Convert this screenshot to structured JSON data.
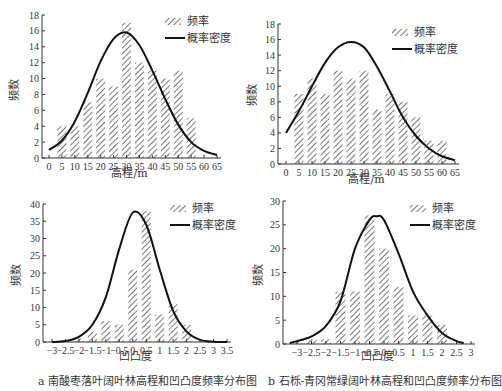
{
  "chart_data": [
    {
      "id": "a-top",
      "type": "bar",
      "title": "",
      "xlabel": "高程/m",
      "ylabel": "频数",
      "x_ticks": [
        "0",
        "5",
        "10",
        "15",
        "20",
        "25",
        "30",
        "35",
        "40",
        "45",
        "50",
        "55",
        "60",
        "65"
      ],
      "y_ticks": [
        "0",
        "2",
        "4",
        "6",
        "8",
        "10",
        "12",
        "14",
        "16",
        "18"
      ],
      "ylim": [
        0,
        18
      ],
      "xlim": [
        0,
        65
      ],
      "categories": [
        5,
        10,
        15,
        20,
        25,
        30,
        35,
        40,
        45,
        50,
        55
      ],
      "series": [
        {
          "name": "频率",
          "type": "bar",
          "values": [
            4,
            4,
            7,
            10,
            9,
            17,
            12,
            11,
            10,
            11,
            5
          ]
        },
        {
          "name": "概率密度",
          "type": "line",
          "x": [
            0,
            5,
            10,
            15,
            20,
            25,
            30,
            35,
            40,
            45,
            50,
            55,
            60,
            65
          ],
          "values": [
            1,
            2.2,
            4.6,
            8.2,
            12.2,
            15,
            15.8,
            14.2,
            11,
            7.4,
            4.2,
            2,
            0.9,
            0.4
          ]
        }
      ],
      "legend": [
        "频率",
        "概率密度"
      ],
      "legend_position": "top-right"
    },
    {
      "id": "b-top",
      "type": "bar",
      "title": "",
      "xlabel": "高程/m",
      "ylabel": "频数",
      "x_ticks": [
        "0",
        "5",
        "10",
        "15",
        "20",
        "25",
        "30",
        "35",
        "40",
        "45",
        "50",
        "55",
        "60",
        "65"
      ],
      "y_ticks": [
        "0",
        "2",
        "4",
        "6",
        "8",
        "10",
        "12",
        "14",
        "16",
        "18"
      ],
      "ylim": [
        0,
        18
      ],
      "xlim": [
        0,
        65
      ],
      "categories": [
        5,
        10,
        15,
        20,
        25,
        30,
        35,
        40,
        45,
        50,
        55,
        60
      ],
      "series": [
        {
          "name": "频率",
          "type": "bar",
          "values": [
            9,
            11,
            9,
            12,
            11,
            12,
            7,
            9,
            8,
            6,
            3,
            3
          ]
        },
        {
          "name": "概率密度",
          "type": "line",
          "x": [
            0,
            5,
            10,
            15,
            20,
            25,
            30,
            35,
            40,
            45,
            50,
            55,
            60,
            65
          ],
          "values": [
            4,
            6.8,
            10,
            13,
            15,
            15.7,
            15,
            12.5,
            9.3,
            6,
            3.6,
            2,
            1,
            0.5
          ]
        }
      ],
      "legend": [
        "频率",
        "概率密度"
      ],
      "legend_position": "top-right"
    },
    {
      "id": "a-bottom",
      "type": "bar",
      "title": "a 南酸枣落叶阔叶林高程和凹凸度频率分布图",
      "xlabel": "凹凸度",
      "ylabel": "频数",
      "x_ticks": [
        "-3",
        "-2.5",
        "-2",
        "-1.5",
        "-1",
        "-0.5",
        "0",
        "0.5",
        "1",
        "1.5",
        "2",
        "2.5",
        "3",
        "3.5"
      ],
      "y_ticks": [
        "0",
        "5",
        "10",
        "15",
        "20",
        "25",
        "30",
        "35",
        "40"
      ],
      "ylim": [
        0,
        40
      ],
      "xlim": [
        -3,
        3.5
      ],
      "categories": [
        -2,
        -1.5,
        -1,
        -0.5,
        0,
        0.5,
        1,
        1.5,
        2
      ],
      "series": [
        {
          "name": "频率",
          "type": "bar",
          "values": [
            1,
            3,
            6,
            5,
            21,
            38,
            8,
            11,
            5
          ]
        },
        {
          "name": "概率密度",
          "type": "line",
          "x": [
            -3,
            -2.5,
            -2,
            -1.5,
            -1,
            -0.5,
            0,
            0.5,
            1,
            1.5,
            2,
            2.5,
            3,
            3.5
          ],
          "values": [
            0,
            0.3,
            1.5,
            5,
            13,
            27,
            37.5,
            34,
            21,
            9,
            3,
            0.6,
            0.1,
            0
          ]
        }
      ],
      "legend": [
        "频率",
        "概率密度"
      ],
      "legend_position": "top-right"
    },
    {
      "id": "b-bottom",
      "type": "bar",
      "title": "b 石栎-青冈常绿阔叶林高程和凹凸度频率分布图",
      "xlabel": "凹凸度",
      "ylabel": "频数",
      "x_ticks": [
        "-3",
        "-2.5",
        "-2",
        "-1.5",
        "-1",
        "-0.5",
        "0",
        "0.5",
        "1",
        "1.5",
        "2",
        "2.5",
        "3"
      ],
      "y_ticks": [
        "0",
        "5",
        "10",
        "15",
        "20",
        "25",
        "30"
      ],
      "ylim": [
        0,
        30
      ],
      "xlim": [
        -3.25,
        3
      ],
      "categories": [
        -3,
        -2.5,
        -2,
        -1.5,
        -1,
        -0.5,
        0,
        0.5,
        1,
        1.5,
        2
      ],
      "series": [
        {
          "name": "频率",
          "type": "bar",
          "values": [
            0.5,
            1,
            1,
            11,
            11,
            27,
            20,
            12,
            6,
            6,
            4
          ]
        },
        {
          "name": "概率密度",
          "type": "line",
          "x": [
            -3.25,
            -3,
            -2.5,
            -2,
            -1.5,
            -1,
            -0.5,
            -0.25,
            0,
            0.5,
            1,
            1.5,
            2,
            2.5,
            2.75
          ],
          "values": [
            0.2,
            0.6,
            1.6,
            3.8,
            9,
            20,
            26,
            26.8,
            26,
            19,
            11,
            6,
            2.3,
            0.6,
            0.2
          ]
        }
      ],
      "legend": [
        "频率",
        "概率密度"
      ],
      "legend_position": "top-right"
    }
  ],
  "legend": {
    "bar": "频率",
    "line": "概率密度"
  },
  "captions": {
    "a": "a 南酸枣落叶阔叶林高程和凹凸度频率分布图",
    "b": "b 石栎-青冈常绿阔叶林高程和凹凸度频率分布图"
  },
  "labels": {
    "height_axis": "高程/m",
    "curvature_axis": "凹凸度",
    "freq_axis": "频数"
  }
}
